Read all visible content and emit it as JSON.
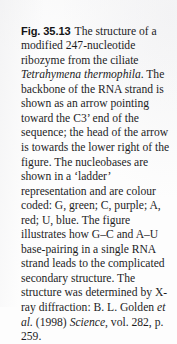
{
  "figure_caption": {
    "label": "Fig. 35.13",
    "body_segments": [
      {
        "type": "text",
        "value": "The structure of a modified 247-nucleotide ribozyme from the ciliate "
      },
      {
        "type": "italic",
        "value": "Tetrahymena thermophila"
      },
      {
        "type": "text",
        "value": ". The backbone of the RNA strand is shown as an arrow pointing toward the C3’ end of the sequence; the head of the arrow is towards the lower right of the figure. The nucleobases are shown in a ‘ladder’ representation and are colour coded: G, green; C, purple; A, red; U, blue. The figure illustrates how G–C and A–U base-pairing in a single RNA strand leads to the complicated secondary structure. The structure was determined by X-ray diffraction: B. L. Golden "
      },
      {
        "type": "italic",
        "value": "et al."
      },
      {
        "type": "text",
        "value": " (1998) "
      },
      {
        "type": "italic",
        "value": "Science"
      },
      {
        "type": "text",
        "value": ", vol. 282, p. 259."
      }
    ],
    "full_text": "Fig. 35.13 The structure of a modified 247-nucleotide ribozyme from the ciliate Tetrahymena thermophila. The backbone of the RNA strand is shown as an arrow pointing toward the C3’ end of the sequence; the head of the arrow is towards the lower right of the figure. The nucleobases are shown in a ‘ladder’ representation and are colour coded: G, green; C, purple; A, red; U, blue. The figure illustrates how G–C and A–U base-pairing in a single RNA strand leads to the complicated secondary structure. The structure was determined by X-ray diffraction: B. L. Golden et al. (1998) Science, vol. 282, p. 259.",
    "nucleobase_colour_key": [
      {
        "base": "G",
        "colour": "green"
      },
      {
        "base": "C",
        "colour": "purple"
      },
      {
        "base": "A",
        "colour": "red"
      },
      {
        "base": "U",
        "colour": "blue"
      }
    ],
    "base_pairings": [
      "G–C",
      "A–U"
    ],
    "citation": {
      "authors": "B. L. Golden",
      "et_al": "et al.",
      "year": "(1998)",
      "journal": "Science",
      "volume": "vol. 282",
      "page": "p. 259."
    },
    "organism": "Tetrahymena thermophila",
    "nucleotide_count": "247",
    "terminus": "C3’",
    "method": "X-ray diffraction"
  },
  "colors": {
    "page_background": "#fdfdfd",
    "text": "#1d1d1f",
    "label_text": "#141416"
  }
}
